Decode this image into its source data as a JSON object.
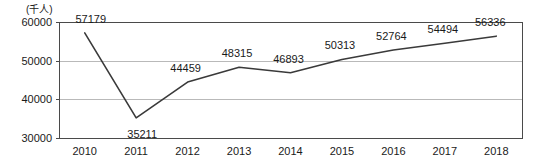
{
  "chart_data": {
    "type": "line",
    "title": "",
    "subtitle": "",
    "xlabel": "",
    "ylabel": "",
    "unit_label": "(千人)",
    "categories": [
      "2010",
      "2011",
      "2012",
      "2013",
      "2014",
      "2015",
      "2016",
      "2017",
      "2018"
    ],
    "series": [
      {
        "name": "",
        "values": [
          57179,
          35211,
          44459,
          48315,
          46893,
          50313,
          52764,
          54494,
          56336
        ]
      }
    ],
    "point_labels": [
      "57179",
      "35211",
      "44459",
      "48315",
      "46893",
      "50313",
      "52764",
      "54494",
      "56336"
    ],
    "ylim": [
      30000,
      60000
    ],
    "yticks": [
      30000,
      40000,
      50000,
      60000
    ],
    "ytick_labels": [
      "30000",
      "40000",
      "50000",
      "60000"
    ],
    "xtick_labels": [
      "2010",
      "2011",
      "2012",
      "2013",
      "2014",
      "2015",
      "2016",
      "2017",
      "2018"
    ],
    "grid": true,
    "grid_axis": "y",
    "legend": false,
    "legend_position": "none",
    "markers": false,
    "colors": {
      "line": "#3a3a3a",
      "grid": "#b9b9b9",
      "axis": "#4a4a4a",
      "text": "#1a1a1a",
      "background": "#ffffff"
    }
  }
}
